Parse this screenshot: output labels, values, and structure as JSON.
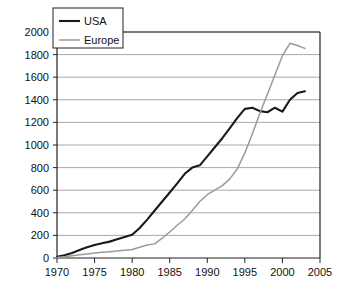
{
  "chart_data": {
    "type": "line",
    "title": "",
    "xlabel": "",
    "ylabel": "",
    "xlim": [
      1970,
      2005
    ],
    "ylim": [
      0,
      2000
    ],
    "xticks": [
      1970,
      1975,
      1980,
      1985,
      1990,
      1995,
      2000,
      2005
    ],
    "yticks": [
      0,
      200,
      400,
      600,
      800,
      1000,
      1200,
      1400,
      1600,
      1800,
      2000
    ],
    "grid": "horizontal",
    "legend_position": "top-left",
    "series": [
      {
        "name": "USA",
        "color": "#1a1a1a",
        "x": [
          1970,
          1971,
          1972,
          1973,
          1974,
          1975,
          1976,
          1977,
          1978,
          1979,
          1980,
          1981,
          1982,
          1983,
          1984,
          1985,
          1986,
          1987,
          1988,
          1989,
          1990,
          1991,
          1992,
          1993,
          1994,
          1995,
          1996,
          1997,
          1998,
          1999,
          2000,
          2001,
          2002,
          2003
        ],
        "values": [
          10,
          25,
          45,
          70,
          95,
          115,
          130,
          145,
          165,
          185,
          205,
          265,
          340,
          420,
          500,
          580,
          660,
          745,
          800,
          820,
          900,
          980,
          1060,
          1150,
          1240,
          1320,
          1330,
          1300,
          1290,
          1330,
          1295,
          1400,
          1460,
          1475
        ]
      },
      {
        "name": "Europe",
        "color": "#9a9a9a",
        "x": [
          1970,
          1971,
          1972,
          1973,
          1974,
          1975,
          1976,
          1977,
          1978,
          1979,
          1980,
          1981,
          1982,
          1983,
          1984,
          1985,
          1986,
          1987,
          1988,
          1989,
          1990,
          1991,
          1992,
          1993,
          1994,
          1995,
          1996,
          1997,
          1998,
          1999,
          2000,
          2001,
          2002,
          2003
        ],
        "values": [
          5,
          12,
          20,
          28,
          36,
          44,
          50,
          56,
          62,
          68,
          75,
          95,
          115,
          125,
          175,
          230,
          290,
          345,
          420,
          500,
          560,
          600,
          640,
          700,
          790,
          930,
          1100,
          1280,
          1450,
          1620,
          1790,
          1900,
          1880,
          1855
        ]
      }
    ],
    "legend": [
      {
        "label": "USA",
        "color": "#1a1a1a"
      },
      {
        "label": "Europe",
        "color": "#9a9a9a"
      }
    ],
    "tick_labels_x": [
      "1970",
      "1975",
      "1980",
      "1985",
      "1990",
      "1995",
      "2000",
      "2005"
    ],
    "tick_labels_y": [
      "0",
      "200",
      "400",
      "600",
      "800",
      "1000",
      "1200",
      "1400",
      "1600",
      "1800",
      "2000"
    ]
  },
  "colors": {
    "axis": "#222222",
    "grid": "#a9a9a9",
    "background": "#ffffff",
    "usa": "#1a1a1a",
    "europe": "#9a9a9a"
  }
}
